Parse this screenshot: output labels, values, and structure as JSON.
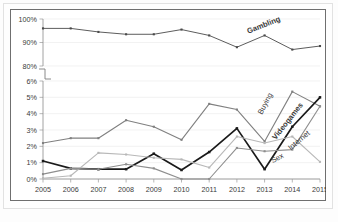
{
  "chart_data": {
    "type": "line",
    "title": "",
    "subtitle": "",
    "xlabel": "",
    "ylabel": "",
    "grid": true,
    "legend_position": "inline-right-labels",
    "axis_break": {
      "present": true,
      "upper_range": [
        80,
        100
      ],
      "lower_range": [
        0,
        6
      ],
      "note": "Y axis broken between 6% and 80%"
    },
    "upper_axis_ticks": [
      "100%",
      "90%",
      "80%"
    ],
    "lower_axis_ticks": [
      "6%",
      "5%",
      "4%",
      "3%",
      "2%",
      "1%",
      "0%"
    ],
    "x": [
      "2005",
      "2006",
      "2007",
      "2008",
      "2009",
      "2010",
      "2011",
      "2012",
      "2013",
      "2014",
      "2015"
    ],
    "categories": [
      "2005",
      "2006",
      "2007",
      "2008",
      "2009",
      "2010",
      "2011",
      "2012",
      "2013",
      "2014",
      "2015"
    ],
    "series": [
      {
        "name": "Gambling",
        "label": "Gambling",
        "panel": "upper",
        "color": "#4a4a4a",
        "stroke_width": 0.9,
        "marker": "square",
        "values": [
          96.0,
          96.0,
          94.5,
          93.5,
          93.5,
          95.5,
          93.0,
          88.0,
          93.0,
          87.0,
          88.5
        ],
        "label_x": 2013.0,
        "label_y": 96.5
      },
      {
        "name": "Buying",
        "label": "Buying",
        "panel": "lower",
        "color": "#808080",
        "stroke_width": 1.1,
        "marker": "square",
        "values": [
          2.2,
          2.5,
          2.5,
          3.6,
          3.2,
          2.4,
          4.6,
          4.25,
          2.3,
          5.35,
          4.45
        ],
        "label_x": 2013.1,
        "label_y": 4.55
      },
      {
        "name": "Videogames",
        "label": "Videogames",
        "panel": "lower",
        "color": "#1a1a1a",
        "stroke_width": 1.7,
        "marker": "square",
        "values": [
          1.1,
          0.65,
          0.6,
          0.6,
          1.55,
          0.55,
          1.65,
          3.1,
          0.6,
          3.2,
          5.0
        ],
        "label_x": 2013.9,
        "label_y": 3.45
      },
      {
        "name": "Internet",
        "label": "Internet",
        "panel": "lower",
        "color": "#b8b8b8",
        "stroke_width": 1.1,
        "marker": "square",
        "values": [
          0.05,
          0.2,
          1.6,
          1.5,
          1.3,
          1.2,
          0.7,
          2.6,
          2.2,
          2.6,
          1.05
        ],
        "label_x": 2014.3,
        "label_y": 2.25
      },
      {
        "name": "Sex",
        "label": "Sex",
        "panel": "lower",
        "color": "#8e8e8e",
        "stroke_width": 1.1,
        "marker": "square",
        "values": [
          0.3,
          0.65,
          0.6,
          0.9,
          0.65,
          0.0,
          0.0,
          1.9,
          1.7,
          1.8,
          4.45
        ],
        "label_x": 2013.5,
        "label_y": 1.15
      }
    ]
  },
  "colors": {
    "frame": "#6f6f6f",
    "grid": "#e9e9e9",
    "axis": "#8a8a8a",
    "background": "#ffffff"
  }
}
